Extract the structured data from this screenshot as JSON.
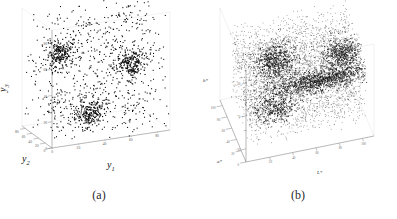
{
  "figure": {
    "background": "#ffffff",
    "ink": "#0a0a0a",
    "axis_color": "#9a9a9a",
    "panel_count": 2
  },
  "panels": [
    {
      "id": "a",
      "caption": "(a)",
      "axis_names": {
        "x": "y",
        "x_sub": "1",
        "y": "y",
        "y_sub": "2",
        "z": "y",
        "z_sub": "3"
      },
      "ticks": {
        "y1": [
          "0",
          "20",
          "40",
          "60",
          "80"
        ],
        "y2": [
          "0",
          "20",
          "40",
          "60",
          "80"
        ],
        "y3": [
          "0",
          "20",
          "40",
          "60",
          "80"
        ]
      }
    },
    {
      "id": "b",
      "caption": "(b)",
      "axis_names": {
        "x": "L*",
        "y": "a*",
        "z": "b*"
      },
      "ticks": {
        "L": [
          "20",
          "40",
          "60",
          "80",
          "100"
        ],
        "a": [
          "0",
          "20",
          "40",
          "60",
          "80",
          "100"
        ],
        "b": [
          "-50",
          "0",
          "50"
        ]
      }
    }
  ],
  "chart_data": [
    {
      "type": "scatter",
      "panel": "a",
      "title": "",
      "projection": "3d",
      "xlabel": "y1",
      "ylabel": "y2",
      "zlabel": "y3",
      "xlim": [
        0,
        90
      ],
      "ylim": [
        0,
        90
      ],
      "zlim": [
        0,
        90
      ],
      "xticks": [
        0,
        20,
        40,
        60,
        80
      ],
      "yticks": [
        0,
        20,
        40,
        60,
        80
      ],
      "zticks": [
        0,
        20,
        40,
        60,
        80
      ],
      "grid": false,
      "legend": null,
      "marker": {
        "color": "#0a0a0a",
        "size": 1.1,
        "shape": "point"
      },
      "n_points": 1400,
      "description": "Three compact Gaussian clusters embedded in uniform background noise over the unit cube scaled to 0-90.",
      "components": [
        {
          "name": "cluster-1",
          "kind": "gaussian",
          "center": [
            22,
            62,
            58
          ],
          "sigma": [
            5,
            5,
            5
          ],
          "n": 210
        },
        {
          "name": "cluster-2",
          "kind": "gaussian",
          "center": [
            66,
            26,
            50
          ],
          "sigma": [
            5,
            5,
            5
          ],
          "n": 210
        },
        {
          "name": "cluster-3",
          "kind": "gaussian",
          "center": [
            40,
            44,
            12
          ],
          "sigma": [
            5,
            5,
            5
          ],
          "n": 210
        },
        {
          "name": "uniform-noise",
          "kind": "uniform",
          "range": [
            [
              0,
              90
            ],
            [
              0,
              90
            ],
            [
              0,
              90
            ]
          ],
          "n": 770
        }
      ]
    },
    {
      "type": "scatter",
      "panel": "b",
      "title": "",
      "projection": "3d",
      "xlabel": "L*",
      "ylabel": "a*",
      "zlabel": "b*",
      "xlim": [
        0,
        110
      ],
      "ylim": [
        0,
        110
      ],
      "zlim": [
        -70,
        70
      ],
      "xticks": [
        20,
        40,
        60,
        80,
        100
      ],
      "yticks": [
        0,
        20,
        40,
        60,
        80,
        100
      ],
      "zticks": [
        -50,
        0,
        50
      ],
      "grid": false,
      "legend": null,
      "marker": {
        "color": "#1a1a1a",
        "size": 0.75,
        "shape": "point"
      },
      "n_points": 6000,
      "description": "Dense CIELAB colour-gamut point cloud: a broad diffuse haze with an elongated high-density streak at mid-high L* and two darker lobes.",
      "components": [
        {
          "name": "diffuse-haze",
          "kind": "uniform",
          "range": [
            [
              5,
              105
            ],
            [
              5,
              100
            ],
            [
              -55,
              55
            ]
          ],
          "n": 3400
        },
        {
          "name": "streak-main",
          "kind": "elongated",
          "center": [
            72,
            40,
            -5
          ],
          "sigma": [
            22,
            7,
            5
          ],
          "n": 1100
        },
        {
          "name": "lobe-left",
          "kind": "gaussian",
          "center": [
            36,
            58,
            22
          ],
          "sigma": [
            9,
            11,
            10
          ],
          "n": 620
        },
        {
          "name": "lobe-right",
          "kind": "gaussian",
          "center": [
            92,
            52,
            18
          ],
          "sigma": [
            8,
            9,
            9
          ],
          "n": 500
        },
        {
          "name": "lobe-lower",
          "kind": "gaussian",
          "center": [
            30,
            24,
            -18
          ],
          "sigma": [
            10,
            9,
            8
          ],
          "n": 380
        }
      ]
    }
  ]
}
